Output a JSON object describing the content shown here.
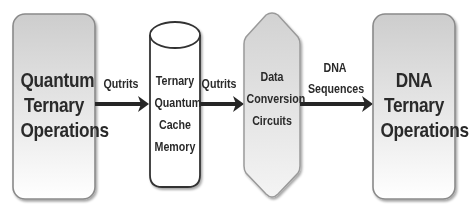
{
  "diagram": {
    "nodes": [
      {
        "id": "quantum-ops",
        "shape": "rounded-rect",
        "lines": [
          "Quantum",
          "Ternary",
          "Operations"
        ]
      },
      {
        "id": "cache-memory",
        "shape": "cylinder",
        "lines": [
          "Ternary",
          "Quantum",
          "Cache",
          "Memory"
        ]
      },
      {
        "id": "conversion",
        "shape": "hexagon",
        "lines": [
          "Data",
          "Conversion",
          "Circuits"
        ]
      },
      {
        "id": "dna-ops",
        "shape": "rounded-rect",
        "lines": [
          "DNA",
          "Ternary",
          "Operations"
        ]
      }
    ],
    "edges": [
      {
        "from": "quantum-ops",
        "to": "cache-memory",
        "lines": [
          "Qutrits"
        ]
      },
      {
        "from": "cache-memory",
        "to": "conversion",
        "lines": [
          "Qutrits"
        ]
      },
      {
        "from": "conversion",
        "to": "dna-ops",
        "lines": [
          "DNA",
          "Sequences"
        ]
      }
    ]
  },
  "colors": {
    "box_gradient_top": "#cfcfcf",
    "box_gradient_bottom": "#ffffff",
    "stroke": "#8a8a8a",
    "arrow": "#262626",
    "text": "#2a2a2a"
  }
}
